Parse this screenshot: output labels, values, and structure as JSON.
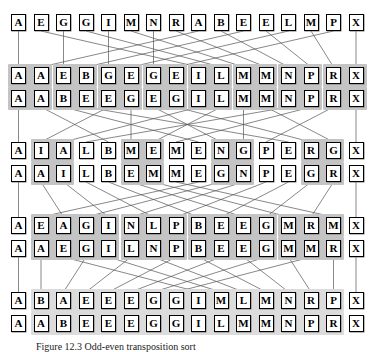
{
  "figure": {
    "caption": "Figure 12.3  Odd-even transposition sort",
    "columns": 16,
    "colors": {
      "box_border": "#000000",
      "box_fill": "#ffffff",
      "highlight": "#d5d5d5",
      "highlight_dark": "#c4c4c4",
      "line": "#555555",
      "text": "#000000"
    },
    "rows": [
      {
        "id": "row-1",
        "label": "initial-sequence",
        "y": 14,
        "cells": [
          "A",
          "E",
          "G",
          "G",
          "I",
          "M",
          "N",
          "R",
          "A",
          "B",
          "E",
          "E",
          "L",
          "M",
          "P",
          "X"
        ],
        "highlights": []
      },
      {
        "id": "row-2",
        "label": "pass-1-before",
        "y": 67,
        "cells": [
          "A",
          "A",
          "E",
          "B",
          "G",
          "E",
          "G",
          "E",
          "I",
          "L",
          "M",
          "M",
          "N",
          "P",
          "R",
          "X"
        ],
        "highlights": [
          [
            0,
            1
          ],
          [
            2,
            3
          ],
          [
            4,
            5
          ],
          [
            6,
            7
          ],
          [
            8,
            9
          ],
          [
            10,
            11
          ],
          [
            12,
            13
          ],
          [
            14,
            15
          ]
        ]
      },
      {
        "id": "row-3",
        "label": "pass-1-after",
        "y": 90,
        "cells": [
          "A",
          "A",
          "B",
          "E",
          "E",
          "G",
          "E",
          "G",
          "I",
          "L",
          "M",
          "M",
          "N",
          "P",
          "R",
          "X"
        ],
        "highlights": [
          [
            0,
            1
          ],
          [
            2,
            3
          ],
          [
            4,
            5
          ],
          [
            6,
            7
          ],
          [
            8,
            9
          ],
          [
            10,
            11
          ],
          [
            12,
            13
          ],
          [
            14,
            15
          ]
        ]
      },
      {
        "id": "row-4",
        "label": "pass-2-before",
        "y": 142,
        "cells": [
          "A",
          "I",
          "A",
          "L",
          "B",
          "M",
          "E",
          "M",
          "E",
          "N",
          "G",
          "P",
          "E",
          "R",
          "G",
          "X"
        ],
        "highlights": [
          [
            1,
            2
          ],
          [
            5,
            6
          ],
          [
            9,
            10
          ],
          [
            13,
            14
          ]
        ]
      },
      {
        "id": "row-5",
        "label": "pass-2-after",
        "y": 165,
        "cells": [
          "A",
          "A",
          "I",
          "L",
          "B",
          "E",
          "M",
          "M",
          "E",
          "G",
          "N",
          "P",
          "E",
          "G",
          "R",
          "X"
        ],
        "highlights": [
          [
            1,
            2
          ],
          [
            5,
            6
          ],
          [
            9,
            10
          ],
          [
            13,
            14
          ]
        ]
      },
      {
        "id": "row-6",
        "label": "pass-3-before",
        "y": 217,
        "cells": [
          "A",
          "E",
          "A",
          "G",
          "I",
          "N",
          "L",
          "P",
          "B",
          "E",
          "E",
          "G",
          "M",
          "R",
          "M",
          "X"
        ],
        "highlights": [
          [
            1,
            4
          ],
          [
            5,
            7
          ],
          [
            8,
            11
          ],
          [
            12,
            14
          ]
        ]
      },
      {
        "id": "row-7",
        "label": "pass-3-after",
        "y": 240,
        "cells": [
          "A",
          "A",
          "E",
          "G",
          "I",
          "L",
          "N",
          "P",
          "B",
          "E",
          "E",
          "G",
          "M",
          "M",
          "R",
          "X"
        ],
        "highlights": [
          [
            1,
            4
          ],
          [
            5,
            7
          ],
          [
            8,
            11
          ],
          [
            12,
            14
          ]
        ]
      },
      {
        "id": "row-8",
        "label": "pass-4-before",
        "y": 292,
        "cells": [
          "A",
          "B",
          "A",
          "E",
          "E",
          "E",
          "G",
          "G",
          "I",
          "M",
          "L",
          "M",
          "N",
          "R",
          "P",
          "X"
        ],
        "highlights": [
          [
            1,
            14
          ]
        ]
      },
      {
        "id": "row-9",
        "label": "pass-4-after",
        "y": 315,
        "cells": [
          "A",
          "A",
          "B",
          "E",
          "E",
          "E",
          "G",
          "G",
          "I",
          "L",
          "M",
          "M",
          "N",
          "P",
          "R",
          "X"
        ],
        "highlights": [
          [
            1,
            14
          ]
        ]
      }
    ],
    "connections": [
      {
        "from_row": 0,
        "to_row": 1,
        "map": [
          0,
          8,
          2,
          9,
          4,
          10,
          6,
          11,
          1,
          12,
          3,
          13,
          5,
          14,
          7,
          15
        ]
      },
      {
        "from_row": 2,
        "to_row": 3,
        "map": [
          0,
          4,
          8,
          12,
          1,
          5,
          9,
          13,
          2,
          6,
          10,
          14,
          3,
          7,
          11,
          15
        ]
      },
      {
        "from_row": 4,
        "to_row": 5,
        "map": [
          0,
          2,
          4,
          6,
          8,
          10,
          12,
          14,
          1,
          3,
          5,
          7,
          9,
          11,
          13,
          15
        ]
      },
      {
        "from_row": 6,
        "to_row": 7,
        "map": [
          0,
          1,
          8,
          2,
          9,
          3,
          10,
          4,
          11,
          5,
          12,
          6,
          13,
          7,
          14,
          15
        ]
      }
    ]
  }
}
